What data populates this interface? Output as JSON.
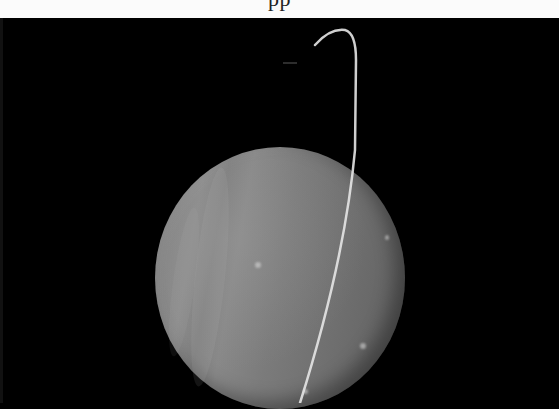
{
  "caption": {
    "text": "pp",
    "visible": "cropped-bottom-of-text"
  },
  "image": {
    "subject": "planet-with-ring",
    "description": "Grayscale image of a banded gas giant planet with a thin bright ring arc crossing in front of the disk against a black background",
    "colors": {
      "background": "#000000",
      "planet_light": "#8a8a8a",
      "planet_dark": "#5f5f5f",
      "ring": "#e8e8e8",
      "caption_bg": "#fbfbfb"
    }
  }
}
